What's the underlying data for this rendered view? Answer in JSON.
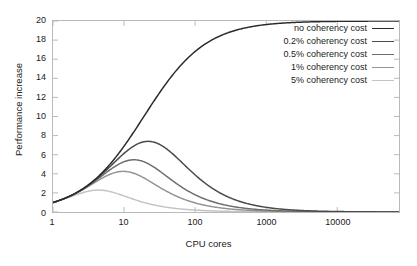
{
  "chart_data": {
    "type": "line",
    "title": "",
    "xlabel": "CPU cores",
    "ylabel": "Performance increase",
    "xscale": "log",
    "yscale": "linear",
    "xlim": [
      1,
      74000
    ],
    "ylim": [
      0,
      20
    ],
    "xticks": [
      1,
      10,
      100,
      1000,
      10000
    ],
    "xtick_labels": [
      "1",
      "10",
      "100",
      "1000",
      "10000"
    ],
    "yticks": [
      0,
      2,
      4,
      6,
      8,
      10,
      12,
      14,
      16,
      18,
      20
    ],
    "ytick_labels": [
      "0",
      "2",
      "4",
      "6",
      "8",
      "10",
      "12",
      "14",
      "16",
      "18",
      "20"
    ],
    "grid": false,
    "legend_position": "top-right",
    "model": "Universal Scalability Law: S(n) = n / (1 + s*(n-1) + k*n*(n-1)), serial fraction s = 0.05",
    "series": [
      {
        "name": "no coherency cost",
        "coherency_cost": 0.0,
        "color": "#2b2b2b",
        "peak": {
          "cores": 74000,
          "value": 19.35
        },
        "x": [
          1,
          2,
          4,
          8,
          16,
          20,
          32,
          50,
          64,
          100,
          128,
          200,
          256,
          400,
          512,
          1000,
          2000,
          4000,
          10000,
          30000,
          74000
        ],
        "y": [
          1.0,
          1.9,
          3.48,
          5.93,
          9.14,
          10.0,
          12.55,
          14.78,
          15.42,
          16.81,
          17.22,
          17.95,
          18.15,
          18.47,
          18.57,
          18.79,
          18.9,
          18.96,
          18.99,
          19.01,
          19.01
        ]
      },
      {
        "name": "0.2% coherency cost",
        "coherency_cost": 0.002,
        "color": "#4a4a4a",
        "peak": {
          "cores": 97,
          "value": 14.2
        },
        "x": [
          1,
          2,
          4,
          8,
          16,
          20,
          32,
          50,
          64,
          97,
          100,
          128,
          200,
          256,
          400,
          512,
          1000,
          2000,
          4000,
          10000,
          30000,
          74000
        ],
        "y": [
          1.0,
          1.9,
          3.45,
          5.78,
          8.53,
          9.21,
          11.0,
          12.61,
          13.19,
          14.2,
          14.19,
          14.1,
          13.42,
          12.77,
          11.18,
          10.17,
          7.1,
          4.35,
          2.44,
          1.07,
          0.37,
          0.15
        ]
      },
      {
        "name": "0.5% coherency cost",
        "coherency_cost": 0.005,
        "color": "#6e6e6e",
        "peak": {
          "cores": 62,
          "value": 12.25
        },
        "x": [
          1,
          2,
          4,
          8,
          16,
          20,
          32,
          50,
          62,
          64,
          100,
          128,
          200,
          256,
          400,
          512,
          1000,
          2000,
          4000,
          10000,
          30000,
          74000
        ],
        "y": [
          1.0,
          1.89,
          3.41,
          5.58,
          7.83,
          8.33,
          9.59,
          10.62,
          10.88,
          10.89,
          10.53,
          10.09,
          8.74,
          7.92,
          6.34,
          5.53,
          3.38,
          1.9,
          1.01,
          0.42,
          0.14,
          0.06
        ]
      },
      {
        "name": "1% coherency cost",
        "coherency_cost": 0.01,
        "color": "#949494",
        "peak": {
          "cores": 44,
          "value": 10.6
        },
        "x": [
          1,
          2,
          4,
          8,
          16,
          20,
          32,
          44,
          50,
          64,
          100,
          128,
          200,
          256,
          400,
          512,
          1000,
          2000,
          4000,
          10000,
          30000,
          74000
        ],
        "y": [
          1.0,
          1.88,
          3.35,
          5.31,
          7.09,
          7.41,
          8.05,
          8.1,
          8.03,
          7.72,
          6.86,
          6.28,
          5.02,
          4.38,
          3.31,
          2.81,
          1.63,
          0.89,
          0.47,
          0.19,
          0.06,
          0.03
        ]
      },
      {
        "name": "5% coherency cost",
        "coherency_cost": 0.05,
        "color": "#c4c4c4",
        "peak": {
          "cores": 20,
          "value": 6.9
        },
        "x": [
          1,
          2,
          4,
          8,
          16,
          20,
          32,
          50,
          64,
          100,
          128,
          200,
          256,
          400,
          512,
          1000,
          2000,
          4000,
          10000,
          30000,
          74000
        ],
        "y": [
          1.0,
          1.85,
          3.08,
          4.36,
          5.02,
          5.05,
          4.7,
          4.08,
          3.74,
          3.03,
          2.69,
          2.01,
          1.72,
          1.22,
          1.0,
          0.55,
          0.29,
          0.15,
          0.06,
          0.02,
          0.01
        ]
      }
    ]
  },
  "legend": {
    "entries": [
      {
        "label": "no coherency cost",
        "color": "#2b2b2b"
      },
      {
        "label": "0.2% coherency cost",
        "color": "#4a4a4a"
      },
      {
        "label": "0.5% coherency cost",
        "color": "#6e6e6e"
      },
      {
        "label": "1% coherency cost",
        "color": "#949494"
      },
      {
        "label": "5% coherency cost",
        "color": "#c4c4c4"
      }
    ]
  },
  "axes": {
    "x_title": "CPU cores",
    "y_title": "Performance increase"
  }
}
